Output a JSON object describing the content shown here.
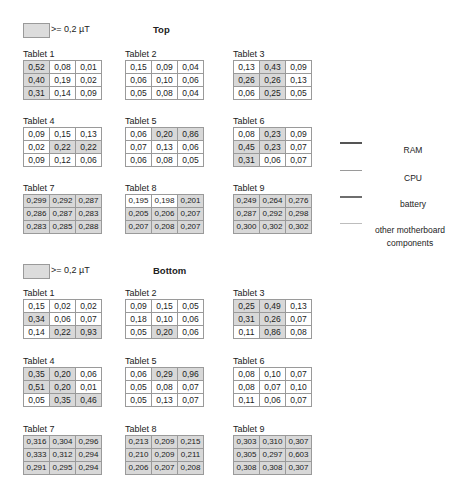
{
  "threshold_legend": {
    "label": ">= 0,2  µT",
    "highlight_color": "#d8d8d8"
  },
  "component_legend": [
    {
      "label": "RAM",
      "color": "#555555",
      "thickness": 2
    },
    {
      "label": "CPU",
      "color": "#9a9a9a",
      "thickness": 1.5
    },
    {
      "label": "battery",
      "color": "#6e6e6e",
      "thickness": 2
    },
    {
      "label": "other motherboard components",
      "color": "#bdbdbd",
      "thickness": 1
    }
  ],
  "sections": [
    {
      "title": "Top",
      "threshold_label": ">= 0,2  µT",
      "tablets": [
        {
          "label": "Tablet 1",
          "rows": [
            [
              "0,52",
              "0,08",
              "0,01"
            ],
            [
              "0,40",
              "0,19",
              "0,02"
            ],
            [
              "0,31",
              "0,14",
              "0,09"
            ]
          ],
          "hi": [
            [
              1,
              0,
              0
            ],
            [
              1,
              0,
              0
            ],
            [
              1,
              0,
              0
            ]
          ]
        },
        {
          "label": "Tablet 2",
          "rows": [
            [
              "0,15",
              "0,09",
              "0,04"
            ],
            [
              "0,06",
              "0,10",
              "0,06"
            ],
            [
              "0,05",
              "0,08",
              "0,04"
            ]
          ],
          "hi": [
            [
              0,
              0,
              0
            ],
            [
              0,
              0,
              0
            ],
            [
              0,
              0,
              0
            ]
          ]
        },
        {
          "label": "Tablet 3",
          "rows": [
            [
              "0,13",
              "0,43",
              "0,09"
            ],
            [
              "0,26",
              "0,26",
              "0,13"
            ],
            [
              "0,06",
              "0,25",
              "0,05"
            ]
          ],
          "hi": [
            [
              0,
              1,
              0
            ],
            [
              1,
              1,
              0
            ],
            [
              0,
              1,
              0
            ]
          ]
        },
        {
          "label": "Tablet 4",
          "rows": [
            [
              "0,09",
              "0,15",
              "0,13"
            ],
            [
              "0,02",
              "0,22",
              "0,22"
            ],
            [
              "0,09",
              "0,12",
              "0,06"
            ]
          ],
          "hi": [
            [
              0,
              0,
              0
            ],
            [
              0,
              1,
              1
            ],
            [
              0,
              0,
              0
            ]
          ]
        },
        {
          "label": "Tablet 5",
          "rows": [
            [
              "0,06",
              "0,20",
              "0,86"
            ],
            [
              "0,07",
              "0,13",
              "0,06"
            ],
            [
              "0,06",
              "0,08",
              "0,05"
            ]
          ],
          "hi": [
            [
              0,
              1,
              1
            ],
            [
              0,
              0,
              0
            ],
            [
              0,
              0,
              0
            ]
          ]
        },
        {
          "label": "Tablet 6",
          "rows": [
            [
              "0,08",
              "0,23",
              "0,09"
            ],
            [
              "0,45",
              "0,23",
              "0,07"
            ],
            [
              "0,31",
              "0,06",
              "0,07"
            ]
          ],
          "hi": [
            [
              0,
              1,
              0
            ],
            [
              1,
              1,
              0
            ],
            [
              1,
              0,
              0
            ]
          ]
        },
        {
          "label": "Tablet 7",
          "rows": [
            [
              "0,299",
              "0,292",
              "0,287"
            ],
            [
              "0,286",
              "0,287",
              "0,283"
            ],
            [
              "0,283",
              "0,285",
              "0,288"
            ]
          ],
          "hi": [
            [
              1,
              1,
              1
            ],
            [
              1,
              1,
              1
            ],
            [
              1,
              1,
              1
            ]
          ]
        },
        {
          "label": "Tablet 8",
          "rows": [
            [
              "0,195",
              "0,198",
              "0,201"
            ],
            [
              "0,205",
              "0,206",
              "0,207"
            ],
            [
              "0,207",
              "0,208",
              "0,207"
            ]
          ],
          "hi": [
            [
              0,
              0,
              1
            ],
            [
              1,
              1,
              1
            ],
            [
              1,
              1,
              1
            ]
          ]
        },
        {
          "label": "Tablet 9",
          "rows": [
            [
              "0,249",
              "0,264",
              "0,276"
            ],
            [
              "0,287",
              "0,292",
              "0,298"
            ],
            [
              "0,300",
              "0,302",
              "0,302"
            ]
          ],
          "hi": [
            [
              1,
              1,
              1
            ],
            [
              1,
              1,
              1
            ],
            [
              1,
              1,
              1
            ]
          ]
        }
      ]
    },
    {
      "title": "Bottom",
      "threshold_label": ">= 0,2  µT",
      "tablets": [
        {
          "label": "Tablet 1",
          "rows": [
            [
              "0,15",
              "0,02",
              "0,02"
            ],
            [
              "0,34",
              "0,06",
              "0,07"
            ],
            [
              "0,14",
              "0,22",
              "0,93"
            ]
          ],
          "hi": [
            [
              0,
              0,
              0
            ],
            [
              1,
              0,
              0
            ],
            [
              0,
              1,
              1
            ]
          ]
        },
        {
          "label": "Tablet 2",
          "rows": [
            [
              "0,09",
              "0,15",
              "0,05"
            ],
            [
              "0,18",
              "0,10",
              "0,06"
            ],
            [
              "0,05",
              "0,20",
              "0,06"
            ]
          ],
          "hi": [
            [
              0,
              0,
              0
            ],
            [
              0,
              0,
              0
            ],
            [
              0,
              1,
              0
            ]
          ]
        },
        {
          "label": "Tablet 3",
          "rows": [
            [
              "0,25",
              "0,49",
              "0,13"
            ],
            [
              "0,31",
              "0,26",
              "0,07"
            ],
            [
              "0,11",
              "0,86",
              "0,08"
            ]
          ],
          "hi": [
            [
              1,
              1,
              0
            ],
            [
              1,
              1,
              0
            ],
            [
              0,
              1,
              0
            ]
          ]
        },
        {
          "label": "Tablet 4",
          "rows": [
            [
              "0,35",
              "0,20",
              "0,06"
            ],
            [
              "0,51",
              "0,20",
              "0,01"
            ],
            [
              "0,05",
              "0,35",
              "0,46"
            ]
          ],
          "hi": [
            [
              1,
              1,
              0
            ],
            [
              1,
              1,
              0
            ],
            [
              0,
              1,
              1
            ]
          ]
        },
        {
          "label": "Tablet 5",
          "rows": [
            [
              "0,06",
              "0,29",
              "0,96"
            ],
            [
              "0,05",
              "0,08",
              "0,07"
            ],
            [
              "0,05",
              "0,13",
              "0,07"
            ]
          ],
          "hi": [
            [
              0,
              1,
              1
            ],
            [
              0,
              0,
              0
            ],
            [
              0,
              0,
              0
            ]
          ]
        },
        {
          "label": "Tablet 6",
          "rows": [
            [
              "0,08",
              "0,10",
              "0,07"
            ],
            [
              "0,08",
              "0,07",
              "0,10"
            ],
            [
              "0,11",
              "0,06",
              "0,07"
            ]
          ],
          "hi": [
            [
              0,
              0,
              0
            ],
            [
              0,
              0,
              0
            ],
            [
              0,
              0,
              0
            ]
          ]
        },
        {
          "label": "Tablet 7",
          "rows": [
            [
              "0,316",
              "0,304",
              "0,296"
            ],
            [
              "0,333",
              "0,312",
              "0,294"
            ],
            [
              "0,291",
              "0,295",
              "0,294"
            ]
          ],
          "hi": [
            [
              1,
              1,
              1
            ],
            [
              1,
              1,
              1
            ],
            [
              1,
              1,
              1
            ]
          ]
        },
        {
          "label": "Tablet 8",
          "rows": [
            [
              "0,213",
              "0,209",
              "0,215"
            ],
            [
              "0,210",
              "0,209",
              "0,211"
            ],
            [
              "0,206",
              "0,207",
              "0,208"
            ]
          ],
          "hi": [
            [
              1,
              1,
              1
            ],
            [
              1,
              1,
              1
            ],
            [
              1,
              1,
              1
            ]
          ]
        },
        {
          "label": "Tablet 9",
          "rows": [
            [
              "0,303",
              "0,310",
              "0,307"
            ],
            [
              "0,305",
              "0,297",
              "0,603"
            ],
            [
              "0,308",
              "0,308",
              "0,307"
            ]
          ],
          "hi": [
            [
              1,
              1,
              1
            ],
            [
              1,
              1,
              1
            ],
            [
              1,
              1,
              1
            ]
          ]
        }
      ]
    }
  ]
}
